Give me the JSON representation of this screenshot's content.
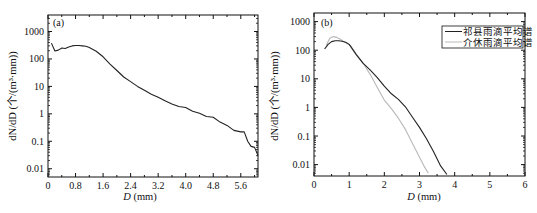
{
  "chart_data": [
    {
      "type": "line",
      "panel": "(a)",
      "title": "",
      "xlabel": "D (mm)",
      "ylabel": "dN/dD (个/(m³·mm))",
      "yscale": "log",
      "xlim": [
        0,
        6.1
      ],
      "ylim": [
        0.005,
        4000
      ],
      "xticks": [
        "0",
        "0.8",
        "1.6",
        "2.4",
        "3.2",
        "4.0",
        "4.8",
        "5.6"
      ],
      "yticks": [
        "0.01",
        "0.1",
        "1",
        "10",
        "100",
        "1000"
      ],
      "grid": false,
      "legend": null,
      "series": [
        {
          "name": "雨滴谱",
          "color": "#222222",
          "x": [
            0.1,
            0.2,
            0.3,
            0.4,
            0.5,
            0.6,
            0.7,
            0.8,
            0.9,
            1.0,
            1.1,
            1.2,
            1.4,
            1.6,
            1.8,
            2.0,
            2.2,
            2.4,
            2.6,
            2.8,
            3.0,
            3.2,
            3.4,
            3.6,
            3.8,
            4.0,
            4.2,
            4.4,
            4.6,
            4.8,
            5.0,
            5.2,
            5.4,
            5.6,
            5.7,
            5.8,
            5.9,
            6.0,
            6.1
          ],
          "y": [
            380,
            195,
            210,
            250,
            240,
            270,
            300,
            310,
            310,
            300,
            290,
            260,
            190,
            120,
            65,
            38,
            22,
            15,
            10,
            7.2,
            5.2,
            4.0,
            3.0,
            2.3,
            1.85,
            1.7,
            1.25,
            1.05,
            0.8,
            0.75,
            0.5,
            0.38,
            0.25,
            0.22,
            0.22,
            0.1,
            0.065,
            0.06,
            0.03
          ]
        }
      ]
    },
    {
      "type": "line",
      "panel": "(b)",
      "title": "",
      "xlabel": "D (mm)",
      "ylabel": "dN/dD (个/(m³·mm))",
      "yscale": "log",
      "xlim": [
        0,
        6
      ],
      "ylim": [
        0.004,
        2000
      ],
      "xticks": [
        "0",
        "1",
        "2",
        "3",
        "4",
        "5",
        "6"
      ],
      "yticks": [
        "0.01",
        "0.1",
        "1",
        "10",
        "100",
        "1000"
      ],
      "grid": false,
      "legend": {
        "position": "upper right",
        "entries": [
          "祁县雨滴平均谱",
          "介休雨滴平均谱"
        ]
      },
      "series": [
        {
          "name": "祁县雨滴平均谱",
          "color": "#222222",
          "x": [
            0.3,
            0.4,
            0.5,
            0.6,
            0.7,
            0.8,
            0.9,
            1.0,
            1.2,
            1.4,
            1.6,
            1.8,
            2.0,
            2.2,
            2.4,
            2.6,
            2.8,
            3.0,
            3.2,
            3.4,
            3.6,
            3.78
          ],
          "y": [
            110,
            160,
            200,
            215,
            215,
            205,
            190,
            160,
            70,
            35,
            20,
            11,
            5.5,
            3.0,
            1.9,
            1.05,
            0.45,
            0.2,
            0.08,
            0.028,
            0.009,
            0.0045
          ]
        },
        {
          "name": "介休雨滴平均谱",
          "color": "#b8b8b8",
          "x": [
            0.35,
            0.45,
            0.55,
            0.65,
            0.75,
            0.85,
            0.95,
            1.05,
            1.2,
            1.4,
            1.6,
            1.8,
            2.0,
            2.2,
            2.4,
            2.6,
            2.8,
            3.0,
            3.15,
            3.25
          ],
          "y": [
            150,
            260,
            300,
            280,
            240,
            200,
            170,
            140,
            75,
            35,
            14,
            5.0,
            1.8,
            0.9,
            0.42,
            0.17,
            0.055,
            0.018,
            0.008,
            0.005
          ]
        }
      ]
    }
  ],
  "panels": {
    "a": {
      "label": "(a)",
      "xlabel_italic": "D",
      "xlabel_unit": " (mm)",
      "ylabel": "dN/dD (个/(m³·mm))"
    },
    "b": {
      "label": "(b)",
      "xlabel_italic": "D",
      "xlabel_unit": " (mm)",
      "ylabel": "dN/dD (个/(m³·mm))",
      "legend": [
        "祁县雨滴平均谱",
        "介休雨滴平均谱"
      ]
    }
  }
}
